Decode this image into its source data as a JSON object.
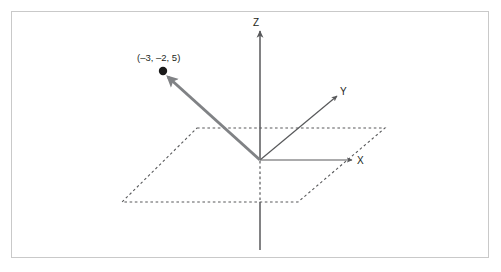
{
  "figure": {
    "type": "3d-coordinate-diagram",
    "title": "",
    "background_color": "#ffffff",
    "frame": {
      "border_color": "#c9c9c9",
      "border_width": 1
    },
    "colors": {
      "axis": "#58595b",
      "vector": "#808285",
      "point": "#1a1a1a",
      "plane_dash": "#58595b",
      "label_text": "#231f20"
    },
    "axes": [
      {
        "name": "z-axis",
        "label": "Z",
        "label_position": {
          "x": 256,
          "y": 26
        },
        "arrow_tip": {
          "x": 260,
          "y": 31
        },
        "origin": {
          "x": 260,
          "y": 160
        },
        "tail_end": {
          "x": 260,
          "y": 250
        },
        "hidden_segment": {
          "from_y": 161,
          "to_y": 202
        }
      },
      {
        "name": "y-axis",
        "label": "Y",
        "label_position": {
          "x": 340,
          "y": 95
        },
        "arrow_tip": {
          "x": 337,
          "y": 96
        },
        "origin": {
          "x": 260,
          "y": 160
        }
      },
      {
        "name": "x-axis",
        "label": "X",
        "label_position": {
          "x": 357,
          "y": 163
        },
        "arrow_tip": {
          "x": 352,
          "y": 160
        },
        "origin": {
          "x": 260,
          "y": 160
        }
      }
    ],
    "plane": {
      "name": "xy-plane",
      "style": "dashed-parallelogram",
      "corners": [
        {
          "x": 197,
          "y": 128
        },
        {
          "x": 385,
          "y": 128
        },
        {
          "x": 298,
          "y": 202
        },
        {
          "x": 122,
          "y": 202
        }
      ]
    },
    "vector": {
      "name": "position-vector",
      "from": {
        "x": 260,
        "y": 160
      },
      "to": {
        "x": 166,
        "y": 75
      },
      "stroke_width": 3,
      "has_arrowhead": true
    },
    "point": {
      "label": "(–3, –2, 5)",
      "coordinates": [
        -3,
        -2,
        5
      ],
      "marker": {
        "x": 163,
        "y": 71,
        "radius": 4.2
      },
      "label_position": {
        "x": 137,
        "y": 61
      }
    }
  }
}
